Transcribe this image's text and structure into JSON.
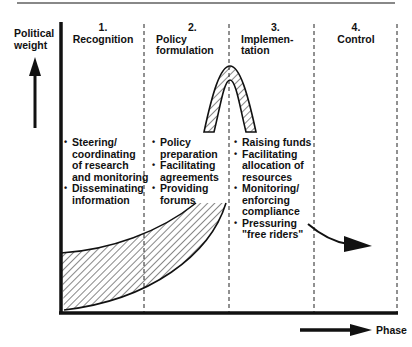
{
  "diagram": {
    "y_axis_label": [
      "Political",
      "weight"
    ],
    "x_axis_label": "Phase",
    "colors": {
      "ink": "#111111",
      "background": "#ffffff",
      "rule": "#888888"
    },
    "phases": [
      {
        "number": "1.",
        "title_lines": [
          "Recognition"
        ],
        "bullets": [
          "Steering/ coordinating of research and monitoring",
          "Disseminating information"
        ],
        "bullet_lines": [
          [
            "Steering/",
            "coordinating",
            "of research",
            "and monitoring"
          ],
          [
            "Disseminating",
            "information"
          ]
        ]
      },
      {
        "number": "2.",
        "title_lines": [
          "Policy",
          "formulation"
        ],
        "bullets": [
          "Policy preparation",
          "Facilitating agreements",
          "Providing forums"
        ],
        "bullet_lines": [
          [
            "Policy",
            "preparation"
          ],
          [
            "Facilitating",
            "agreements"
          ],
          [
            "Providing",
            "forums"
          ]
        ]
      },
      {
        "number": "3.",
        "title_lines": [
          "Implemen-",
          "tation"
        ],
        "bullets": [
          "Raising funds",
          "Facilitating allocation of resources",
          "Monitoring/ enforcing compliance",
          "Pressuring \"free riders\""
        ],
        "bullet_lines": [
          [
            "Raising funds"
          ],
          [
            "Facilitating",
            "allocation of",
            "resources"
          ],
          [
            "Monitoring/",
            "enforcing",
            "compliance"
          ],
          [
            "Pressuring",
            "\"free riders\""
          ]
        ]
      },
      {
        "number": "4.",
        "title_lines": [
          "Control"
        ],
        "bullets": [],
        "bullet_lines": []
      }
    ],
    "curve": {
      "description": "Hatched band of political weight rising from phase 1 through phase 2, peaking at the boundary of phases 2 and 3, then falling into phase 4 (continued as an arrow)",
      "shape": "hatched-band-with-arrow"
    }
  }
}
